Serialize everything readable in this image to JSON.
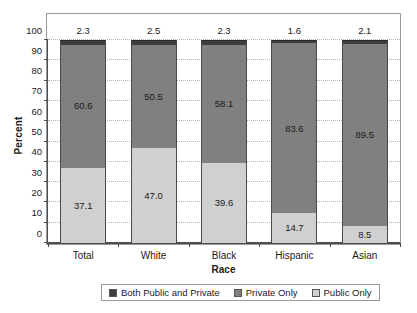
{
  "chart_data": {
    "type": "bar",
    "subtype": "stacked-bar-100",
    "title": "",
    "xlabel": "Race",
    "ylabel": "Percent",
    "categories": [
      "Total",
      "White",
      "Black",
      "Hispanic",
      "Asian"
    ],
    "ylim": [
      0,
      100
    ],
    "yticks": [
      0,
      10,
      20,
      30,
      40,
      50,
      60,
      70,
      80,
      90,
      100
    ],
    "ytick_labels": [
      "0",
      "10",
      "20",
      "30",
      "40",
      "50",
      "60",
      "70",
      "80",
      "90",
      "100"
    ],
    "grid": true,
    "legend_position": "bottom",
    "series": [
      {
        "name": "Public Only",
        "color": "#d0d0d0",
        "values": [
          37.1,
          47.0,
          39.6,
          14.7,
          8.5
        ],
        "labels": [
          "37.1",
          "47.0",
          "39.6",
          "14.7",
          "8.5"
        ],
        "label_placement": "inside"
      },
      {
        "name": "Private Only",
        "color": "#808080",
        "values": [
          60.6,
          50.5,
          58.1,
          83.6,
          89.5
        ],
        "labels": [
          "60.6",
          "50.5",
          "58.1",
          "83.6",
          "89.5"
        ],
        "label_placement": "inside"
      },
      {
        "name": "Both Public and Private",
        "color": "#3d3d3d",
        "values": [
          2.3,
          2.5,
          2.3,
          1.6,
          2.1
        ],
        "labels": [
          "2.3",
          "2.5",
          "2.3",
          "1.6",
          "2.1"
        ],
        "label_placement": "above"
      }
    ]
  },
  "axes": {
    "y_title": "Percent",
    "x_title": "Race"
  },
  "legend": {
    "items": [
      {
        "label": "Both Public and Private",
        "color": "#3d3d3d"
      },
      {
        "label": "Private Only",
        "color": "#808080"
      },
      {
        "label": "Public Only",
        "color": "#d0d0d0"
      }
    ]
  },
  "colors": {
    "both_public_and_private": "#3d3d3d",
    "private_only": "#808080",
    "public_only": "#d0d0d0",
    "frame": "#9a9a9a",
    "axis": "#4d4d4d",
    "gridline": "#b5b5b5",
    "background": "#ffffff",
    "text": "#1a1a1a"
  }
}
